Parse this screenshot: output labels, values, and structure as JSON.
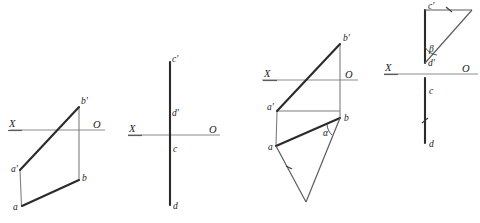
{
  "figure": {
    "background_color": "#ffffff",
    "line_color_heavy": "#2b2b2b",
    "line_color_thin": "#7d7d7d",
    "axis_color": "#8c8c8c",
    "label_color": "#1a1a1a"
  },
  "panels": [
    {
      "id": "panel-1",
      "name": "segment-ab-general-position",
      "axis": {
        "left_label": "X",
        "right_label": "O",
        "y": 130,
        "x_start": 10,
        "x_end": 105
      },
      "points": [
        {
          "key": "b_prime",
          "label": "b'",
          "x": 79,
          "y": 107
        },
        {
          "key": "a_prime",
          "label": "a'",
          "x": 20,
          "y": 170
        },
        {
          "key": "b",
          "label": "b",
          "x": 79,
          "y": 180
        },
        {
          "key": "a",
          "label": "a",
          "x": 22,
          "y": 206
        }
      ]
    },
    {
      "id": "panel-2",
      "name": "segment-cd-profile-line",
      "axis": {
        "left_label": "X",
        "right_label": "O",
        "y": 135,
        "x_start": 128,
        "x_end": 220
      },
      "points": [
        {
          "key": "c_prime",
          "label": "c'",
          "x": 170,
          "y": 62
        },
        {
          "key": "d_prime",
          "label": "d'",
          "x": 170,
          "y": 112
        },
        {
          "key": "c",
          "label": "c",
          "x": 170,
          "y": 147
        },
        {
          "key": "d",
          "label": "d",
          "x": 170,
          "y": 205
        }
      ]
    },
    {
      "id": "panel-3",
      "name": "segment-ab-true-length-alpha",
      "axis": {
        "left_label": "X",
        "right_label": "O",
        "y": 80,
        "x_start": 262,
        "x_end": 358
      },
      "points": [
        {
          "key": "b_prime",
          "label": "b'",
          "x": 340,
          "y": 44
        },
        {
          "key": "a_prime",
          "label": "a'",
          "x": 277,
          "y": 111
        },
        {
          "key": "b",
          "label": "b",
          "x": 340,
          "y": 118
        },
        {
          "key": "a",
          "label": "a",
          "x": 276,
          "y": 146
        },
        {
          "key": "apex",
          "label": "",
          "x": 306,
          "y": 202
        }
      ],
      "angle": {
        "symbol": "α",
        "x": 327,
        "y": 133,
        "at_point": "b"
      }
    },
    {
      "id": "panel-4",
      "name": "segment-cd-true-length-beta",
      "axis": {
        "left_label": "X",
        "right_label": "O",
        "y": 74,
        "x_start": 384,
        "x_end": 478
      },
      "points": [
        {
          "key": "c_prime",
          "label": "c'",
          "x": 425,
          "y": 10
        },
        {
          "key": "d_prime",
          "label": "d'",
          "x": 425,
          "y": 63
        },
        {
          "key": "c",
          "label": "c",
          "x": 425,
          "y": 90
        },
        {
          "key": "d",
          "label": "d",
          "x": 425,
          "y": 143
        },
        {
          "key": "corner",
          "label": "",
          "x": 472,
          "y": 10
        }
      ],
      "angle": {
        "symbol": "β",
        "x": 432,
        "y": 48,
        "at_point": "d'"
      }
    }
  ]
}
